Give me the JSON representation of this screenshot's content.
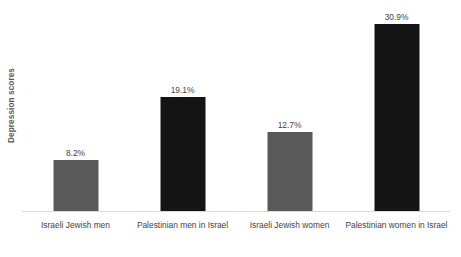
{
  "chart_data": {
    "type": "bar",
    "title": "",
    "xlabel": "",
    "ylabel": "Depression scores",
    "categories": [
      "Israeli Jewish men",
      "Palestinian men in Israel",
      "Israeli Jewish women",
      "Palestinian women in Israel"
    ],
    "values": [
      8.2,
      12.7,
      19.1,
      30.9
    ],
    "value_labels": [
      "8.2%",
      "19.1%",
      "12.7%",
      "30.9%"
    ],
    "ordered_values": [
      8.2,
      19.1,
      12.7,
      30.9
    ],
    "bar_colors": [
      "#595959",
      "#141414",
      "#595959",
      "#141414"
    ],
    "ylim": [
      0,
      34.9
    ],
    "grid": false,
    "legend": false,
    "axis_line_color": "#d9d9d9",
    "bars": [
      {
        "category": "Israeli Jewish men",
        "value": 8.2,
        "label": "8.2%",
        "color": "#595959",
        "height_px": 51
      },
      {
        "category": "Palestinian men in Israel",
        "value": 19.1,
        "label": "19.1%",
        "color": "#141414",
        "height_px": 114
      },
      {
        "category": "Israeli Jewish women",
        "value": 12.7,
        "label": "12.7%",
        "color": "#595959",
        "height_px": 79
      },
      {
        "category": "Palestinian women in Israel",
        "value": 30.9,
        "label": "30.9%",
        "color": "#141414",
        "height_px": 187
      }
    ]
  }
}
